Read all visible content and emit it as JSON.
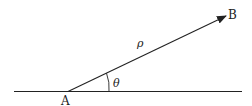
{
  "diagram": {
    "labels": {
      "point_a": "A",
      "point_b": "B",
      "vector": "ρ",
      "angle": "θ"
    },
    "colors": {
      "stroke": "#222222",
      "background": "#ffffff"
    }
  }
}
